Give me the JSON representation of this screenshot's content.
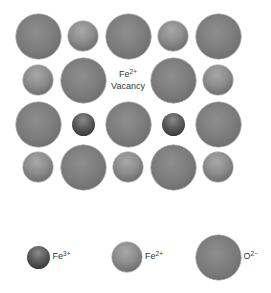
{
  "diagram": {
    "colors": {
      "background": "#ffffff",
      "O2-": "#7a7a7a",
      "Fe2+": "#8c8c8c",
      "Fe3+": "#4a4a4a",
      "text": "#333333"
    },
    "ion_sizes_px": {
      "O2-": 45,
      "Fe2+": 30,
      "Fe3+": 23
    },
    "lattice": {
      "columns_x": [
        38,
        83,
        128,
        173,
        218
      ],
      "rows_y": [
        36,
        80,
        124,
        167
      ],
      "rows": [
        [
          "O2-",
          "Fe2+",
          "O2-",
          "Fe2+",
          "O2-"
        ],
        [
          "Fe2+",
          "O2-",
          "vacancy",
          "O2-",
          "Fe2+"
        ],
        [
          "O2-",
          "Fe3+",
          "O2-",
          "Fe3+",
          "O2-"
        ],
        [
          "Fe2+",
          "O2-",
          "Fe2+",
          "O2-",
          "Fe2+"
        ]
      ]
    },
    "vacancy_label": {
      "element": "Fe",
      "charge": "2+",
      "word": "Vacancy"
    },
    "legend": [
      {
        "ion": "Fe3+",
        "element": "Fe",
        "charge": "3+",
        "cx": 38,
        "cy": 257
      },
      {
        "ion": "Fe2+",
        "element": "Fe",
        "charge": "2+",
        "cx": 127,
        "cy": 257
      },
      {
        "ion": "O2-",
        "element": "O",
        "charge": "2−",
        "cx": 218,
        "cy": 257
      }
    ]
  }
}
